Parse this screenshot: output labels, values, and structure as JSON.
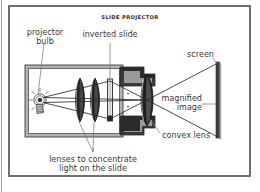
{
  "figure": {
    "title": "SLIDE PROJECTOR",
    "type": "optics-ray-diagram"
  },
  "labels": {
    "projector_bulb": "projector\nbulb",
    "inverted_slide": "inverted slide",
    "screen": "screen",
    "magnified_image": "magnified\nimage",
    "convex_lens": "convex lens",
    "condenser_lenses": "lenses to concentrate\nlight on the slide"
  },
  "colors": {
    "frame": "#6f6f6f",
    "ink": "#3a3a3a",
    "body_outline": "#555555",
    "body_fill": "#b0b0b0",
    "barrel_dark": "#2f2f2f",
    "barrel_mid": "#8c8c8c",
    "lens_dark": "#1f1f1f",
    "screen": "#3d3d3d",
    "ray": "#2b2b2b",
    "page_rule": "#9a9a9a"
  },
  "components": [
    {
      "name": "projector-bulb",
      "x": 40,
      "y": 103,
      "note": "light source inside housing"
    },
    {
      "name": "condenser-lens-1",
      "x": 80,
      "y": 100,
      "note": "first concentrating lens"
    },
    {
      "name": "condenser-lens-2",
      "x": 95,
      "y": 100,
      "note": "second concentrating lens"
    },
    {
      "name": "inverted-slide",
      "x": 110,
      "y": 100,
      "note": "slide sits upside down"
    },
    {
      "name": "convex-lens",
      "x": 147,
      "y": 100,
      "note": "projection lens in barrel"
    },
    {
      "name": "screen",
      "x": 218,
      "y": 100,
      "note": "image is projected here"
    }
  ]
}
